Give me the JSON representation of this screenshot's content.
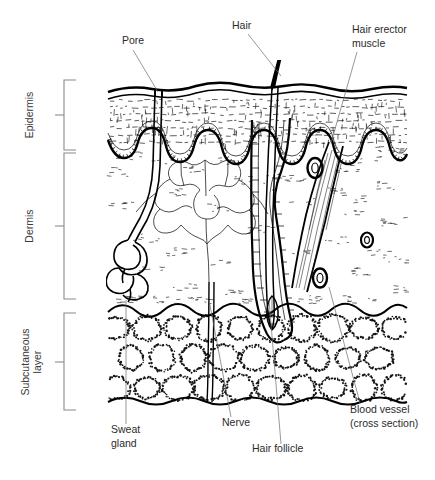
{
  "figure": {
    "background_color": "#ffffff",
    "ink_color": "#000000",
    "label_color": "#2b2b2b",
    "leader_color": "#6d6d6d",
    "bracket_color": "#8a8a8a",
    "width": 435,
    "height": 480
  },
  "layer_brackets": [
    {
      "id": "epidermis",
      "label": "Epidermis",
      "label_x": 33,
      "label_y": 115,
      "bracket_top": 80,
      "bracket_bottom": 150,
      "bracket_x": 72,
      "tick_y": 115
    },
    {
      "id": "dermis",
      "label": "Dermis",
      "label_x": 33,
      "label_y": 225,
      "bracket_top": 153,
      "bracket_bottom": 299,
      "bracket_x": 72,
      "tick_y": 226
    },
    {
      "id": "subcutaneous",
      "label_line1": "Subcutaneous",
      "label_line2": "layer",
      "label_x": 30,
      "label_y": 362,
      "bracket_top": 313,
      "bracket_bottom": 410,
      "bracket_x": 72,
      "tick_y": 362
    }
  ],
  "callouts": [
    {
      "id": "pore",
      "label": "Pore",
      "lines": [
        "Pore"
      ],
      "text_x": 122,
      "text_y": 44,
      "anchor": "start",
      "leader": "M 133 50 L 158 92"
    },
    {
      "id": "hair",
      "label": "Hair",
      "lines": [
        "Hair"
      ],
      "text_x": 232,
      "text_y": 29,
      "anchor": "start",
      "leader": "M 248 34 L 280 75"
    },
    {
      "id": "hair-erector-muscle",
      "label": "Hair erector muscle",
      "lines": [
        "Hair erector",
        "muscle"
      ],
      "text_x": 352,
      "text_y": 33,
      "anchor": "start",
      "leader": "M 357 52 L 330 142"
    },
    {
      "id": "sweat-gland",
      "label": "Sweat gland",
      "lines": [
        "Sweat",
        "gland"
      ],
      "text_x": 111,
      "text_y": 433,
      "anchor": "start",
      "leader": "M 126 424 L 126 300"
    },
    {
      "id": "nerve",
      "label": "Nerve",
      "lines": [
        "Nerve"
      ],
      "text_x": 222,
      "text_y": 426,
      "anchor": "start",
      "leader": "M 231 417 L 208 300"
    },
    {
      "id": "hair-follicle",
      "label": "Hair follicle",
      "lines": [
        "Hair follicle"
      ],
      "text_x": 252,
      "text_y": 452,
      "anchor": "start",
      "leader": "M 281 444 L 268 300"
    },
    {
      "id": "blood-vessel",
      "label": "Blood vessel (cross section)",
      "lines": [
        "Blood vessel",
        "(cross section)"
      ],
      "text_x": 350,
      "text_y": 413,
      "anchor": "start",
      "leader": "M 360 403 L 330 287"
    }
  ],
  "structures": {
    "skin_surface": "wavy double line",
    "epidermis_texture": "dashed horizontal cell rows",
    "basal_layer": "scalloped beaded rete ridges",
    "dermis_contents": [
      "sweat gland coil",
      "sebaceous gland",
      "hair follicle",
      "hair erector muscle",
      "nerve",
      "blood vessels"
    ],
    "subcutaneous_texture": "stippled fat lobules",
    "blood_vessel_ovals": [
      {
        "cx": 315,
        "cy": 168,
        "rx": 7.5,
        "ry": 10
      },
      {
        "cx": 367,
        "cy": 240,
        "rx": 6,
        "ry": 7.5
      },
      {
        "cx": 320,
        "cy": 278,
        "rx": 7,
        "ry": 9.5
      }
    ]
  }
}
